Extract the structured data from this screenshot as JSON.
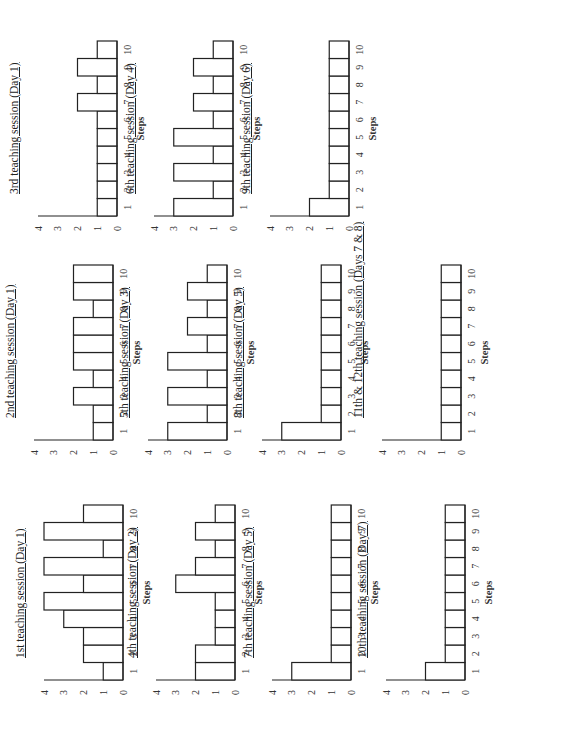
{
  "chart_data": [
    {
      "type": "bar",
      "title": "1st teaching session (Day 1)",
      "xlabel": "Steps",
      "ylabel": "",
      "categories": [
        "1",
        "2",
        "3",
        "4",
        "5",
        "6",
        "7",
        "8",
        "9",
        "10"
      ],
      "values": [
        1,
        2,
        2,
        3,
        4,
        2,
        4,
        1,
        4,
        2
      ],
      "ylim": [
        0,
        4
      ],
      "yticks": [
        "0",
        "1",
        "2",
        "3",
        "4"
      ],
      "grid": false
    },
    {
      "type": "bar",
      "title": "2nd teaching session (Day 1)",
      "xlabel": "Steps",
      "ylabel": "",
      "categories": [
        "1",
        "2",
        "3",
        "4",
        "5",
        "6",
        "7",
        "8",
        "9",
        "10"
      ],
      "values": [
        1,
        1,
        2,
        1,
        2,
        2,
        2,
        1,
        2,
        2
      ],
      "ylim": [
        0,
        4
      ],
      "yticks": [
        "0",
        "1",
        "2",
        "3",
        "4"
      ],
      "grid": false
    },
    {
      "type": "bar",
      "title": "3rd teaching session (Day 1)",
      "xlabel": "Steps",
      "ylabel": "",
      "categories": [
        "1",
        "2",
        "3",
        "4",
        "5",
        "6",
        "7",
        "8",
        "9",
        "10"
      ],
      "values": [
        1,
        1,
        1,
        1,
        1,
        1,
        2,
        1,
        2,
        1
      ],
      "ylim": [
        0,
        4
      ],
      "yticks": [
        "0",
        "1",
        "2",
        "3",
        "4"
      ],
      "grid": false
    },
    {
      "type": "bar",
      "title": "4th teaching session (Day 2)",
      "xlabel": "Steps",
      "ylabel": "",
      "categories": [
        "1",
        "2",
        "3",
        "4",
        "5",
        "6",
        "7",
        "8",
        "9",
        "10"
      ],
      "values": [
        2,
        2,
        1,
        1,
        1,
        3,
        2,
        1,
        2,
        1
      ],
      "ylim": [
        0,
        4
      ],
      "yticks": [
        "0",
        "1",
        "2",
        "3",
        "4"
      ],
      "grid": false
    },
    {
      "type": "bar",
      "title": "5th teaching session (Day 3)",
      "xlabel": "Steps",
      "ylabel": "",
      "categories": [
        "1",
        "2",
        "3",
        "4",
        "5",
        "6",
        "7",
        "8",
        "9",
        "10"
      ],
      "values": [
        3,
        1,
        3,
        1,
        3,
        1,
        2,
        1,
        2,
        1
      ],
      "ylim": [
        0,
        4
      ],
      "yticks": [
        "0",
        "1",
        "2",
        "3",
        "4"
      ],
      "grid": false
    },
    {
      "type": "bar",
      "title": "6th teaching session (Day 4)",
      "xlabel": "Steps",
      "ylabel": "",
      "categories": [
        "1",
        "2",
        "3",
        "4",
        "5",
        "6",
        "7",
        "8",
        "9",
        "10"
      ],
      "values": [
        3,
        1,
        3,
        1,
        3,
        1,
        2,
        1,
        2,
        1
      ],
      "ylim": [
        0,
        4
      ],
      "yticks": [
        "0",
        "1",
        "2",
        "3",
        "4"
      ],
      "grid": false
    },
    {
      "type": "bar",
      "title": "7th teaching session (Day 5)",
      "xlabel": "Steps",
      "ylabel": "",
      "categories": [
        "1",
        "2",
        "3",
        "4",
        "5",
        "6",
        "7",
        "8",
        "9",
        "10"
      ],
      "values": [
        3,
        1,
        1,
        1,
        1,
        1,
        1,
        1,
        1,
        1
      ],
      "ylim": [
        0,
        4
      ],
      "yticks": [
        "0",
        "1",
        "2",
        "3",
        "4"
      ],
      "grid": false
    },
    {
      "type": "bar",
      "title": "8th teaching session (Day 5)",
      "xlabel": "Steps",
      "ylabel": "",
      "categories": [
        "1",
        "2",
        "3",
        "4",
        "5",
        "6",
        "7",
        "8",
        "9",
        "10"
      ],
      "values": [
        3,
        1,
        1,
        1,
        1,
        1,
        1,
        1,
        1,
        1
      ],
      "ylim": [
        0,
        4
      ],
      "yticks": [
        "0",
        "1",
        "2",
        "3",
        "4"
      ],
      "grid": false
    },
    {
      "type": "bar",
      "title": "9th teaching session (Day 6)",
      "xlabel": "Steps",
      "ylabel": "",
      "categories": [
        "1",
        "2",
        "3",
        "4",
        "5",
        "6",
        "7",
        "8",
        "9",
        "10"
      ],
      "values": [
        2,
        1,
        1,
        1,
        1,
        1,
        1,
        1,
        1,
        1
      ],
      "ylim": [
        0,
        4
      ],
      "yticks": [
        "0",
        "1",
        "2",
        "3",
        "4"
      ],
      "grid": false
    },
    {
      "type": "bar",
      "title": "10th teaching session (Day 7)",
      "xlabel": "Steps",
      "ylabel": "",
      "categories": [
        "1",
        "2",
        "3",
        "4",
        "5",
        "6",
        "7",
        "8",
        "9",
        "10"
      ],
      "values": [
        2,
        1,
        1,
        1,
        1,
        1,
        1,
        1,
        1,
        1
      ],
      "ylim": [
        0,
        4
      ],
      "yticks": [
        "0",
        "1",
        "2",
        "3",
        "4"
      ],
      "grid": false
    },
    {
      "type": "bar",
      "title": "11th & 12th teaching session (Days 7 & 8)",
      "xlabel": "Steps",
      "ylabel": "",
      "categories": [
        "1",
        "2",
        "3",
        "4",
        "5",
        "6",
        "7",
        "8",
        "9",
        "10"
      ],
      "values": [
        1,
        1,
        1,
        1,
        1,
        1,
        1,
        1,
        1,
        1
      ],
      "ylim": [
        0,
        4
      ],
      "yticks": [
        "0",
        "1",
        "2",
        "3",
        "4"
      ],
      "grid": false
    }
  ],
  "layout": {
    "orientation": "page rotated 90 degrees counter-clockwise",
    "panels": [
      {
        "chart": 0,
        "left": 38,
        "top": 20
      },
      {
        "chart": 3,
        "left": 38,
        "top": 132
      },
      {
        "chart": 6,
        "left": 38,
        "top": 248
      },
      {
        "chart": 9,
        "left": 38,
        "top": 362
      },
      {
        "chart": 1,
        "left": 278,
        "top": 10
      },
      {
        "chart": 4,
        "left": 278,
        "top": 124
      },
      {
        "chart": 7,
        "left": 278,
        "top": 238
      },
      {
        "chart": 10,
        "left": 278,
        "top": 358
      },
      {
        "chart": 2,
        "left": 502,
        "top": 14
      },
      {
        "chart": 5,
        "left": 502,
        "top": 130
      },
      {
        "chart": 8,
        "left": 502,
        "top": 246
      }
    ]
  }
}
